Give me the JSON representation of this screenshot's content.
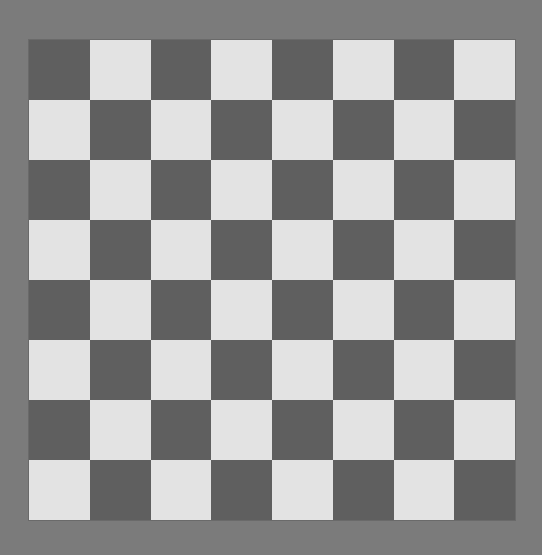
{
  "board": {
    "rows": 8,
    "cols": 8,
    "top_left_color": "dark",
    "colors": {
      "dark": "#5f5f5f",
      "light": "#e3e3e3",
      "background": "#7b7b7b"
    },
    "pieces": []
  }
}
